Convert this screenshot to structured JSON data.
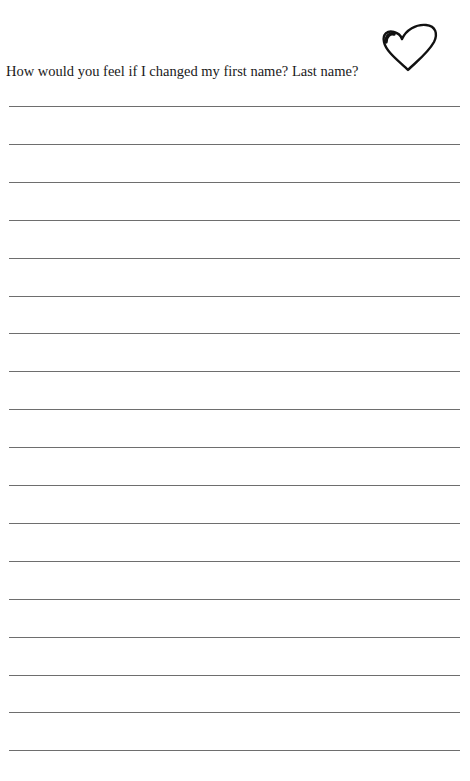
{
  "worksheet": {
    "prompt": "How would you feel if I changed my first name? Last name?",
    "decoration_icon": "heart-outline-icon",
    "writing_lines": {
      "count": 18,
      "first_y": 106,
      "spacing": 37.9
    }
  }
}
